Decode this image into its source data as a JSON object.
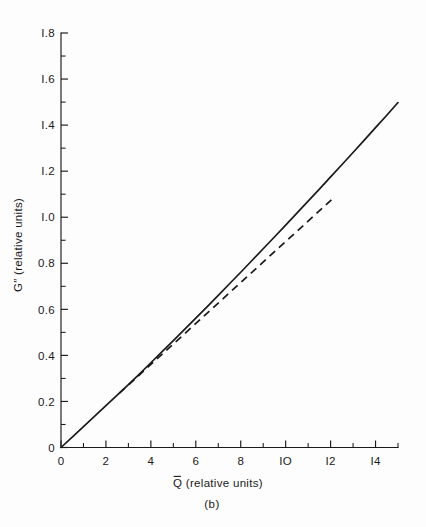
{
  "figure": {
    "caption": "(b)",
    "background_color": "#fdfdfd",
    "ink_color": "#1a1a1a"
  },
  "chart_data": {
    "type": "line",
    "title": "",
    "xlabel": "Q̅ (relative units)",
    "xlabel_base": "Q",
    "xlabel_suffix": " (relative units)",
    "ylabel": "G″ (relative units)",
    "ylabel_base": "G",
    "ylabel_prime": "″",
    "ylabel_suffix": " (relative units)",
    "xlim": [
      0,
      15
    ],
    "ylim": [
      0,
      1.8
    ],
    "grid": false,
    "legend": "none",
    "x_major_ticks": [
      0,
      2,
      4,
      6,
      8,
      10,
      12,
      14
    ],
    "x_major_tick_labels": [
      "0",
      "2",
      "4",
      "6",
      "8",
      "IO",
      "I2",
      "I4"
    ],
    "x_minor_ticks": [
      1,
      3,
      5,
      7,
      9,
      11,
      13,
      15
    ],
    "y_major_ticks": [
      0,
      0.2,
      0.4,
      0.6,
      0.8,
      1.0,
      1.2,
      1.4,
      1.6,
      1.8
    ],
    "y_major_tick_labels": [
      "0",
      "0.2",
      "0.4",
      "0.6",
      "0.8",
      "I.0",
      "I.2",
      "I.4",
      "I.6",
      "I.8"
    ],
    "y_minor_ticks": [
      0.1,
      0.3,
      0.5,
      0.7,
      0.9,
      1.1,
      1.3,
      1.5,
      1.7
    ],
    "series": [
      {
        "name": "solid-curve",
        "style": "solid",
        "x": [
          0,
          0.5,
          1,
          1.5,
          2,
          2.5,
          3,
          3.5,
          4,
          4.5,
          5,
          5.5,
          6,
          6.5,
          7,
          7.5,
          8,
          8.5,
          9,
          9.5,
          10,
          10.5,
          11,
          11.5,
          12,
          12.5,
          13,
          13.5,
          14,
          14.5,
          15
        ],
        "y": [
          0,
          0.045,
          0.091,
          0.136,
          0.182,
          0.227,
          0.273,
          0.32,
          0.368,
          0.416,
          0.464,
          0.513,
          0.562,
          0.611,
          0.661,
          0.711,
          0.761,
          0.812,
          0.863,
          0.914,
          0.966,
          1.018,
          1.07,
          1.122,
          1.175,
          1.228,
          1.281,
          1.335,
          1.389,
          1.443,
          1.498
        ]
      },
      {
        "name": "dashed-line",
        "style": "dashed",
        "x": [
          2.6,
          12.2
        ],
        "y": [
          0.236,
          1.09
        ]
      }
    ]
  }
}
